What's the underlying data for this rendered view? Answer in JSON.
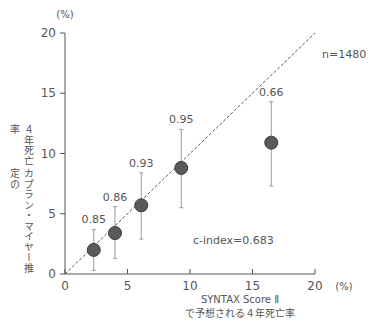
{
  "chart_data": {
    "type": "scatter",
    "title": "",
    "xlabel": "SYNTAX Score II で予想される４年死亡率",
    "xlabel_lines": [
      "SYNTAX Score Ⅱ",
      "で予想される４年死亡率"
    ],
    "ylabel": "カプラン・マイヤー推定の４年死亡率",
    "ylabel_lines": [
      "カプラン・マイヤー推定の",
      "４年死亡率"
    ],
    "x_unit": "(%)",
    "y_unit": "(%)",
    "xlim": [
      0,
      20
    ],
    "ylim": [
      0,
      20
    ],
    "x_ticks": [
      0,
      5,
      10,
      15,
      20
    ],
    "y_ticks": [
      0,
      5,
      10,
      15,
      20
    ],
    "grid": false,
    "reference_line": {
      "style": "dashed",
      "from": [
        0,
        0
      ],
      "to": [
        20,
        20
      ]
    },
    "points": [
      {
        "x": 2.3,
        "y": 2.0,
        "err_low": 0.3,
        "err_high": 3.7,
        "label": "0.85"
      },
      {
        "x": 4.0,
        "y": 3.4,
        "err_low": 1.3,
        "err_high": 5.6,
        "label": "0.86"
      },
      {
        "x": 6.1,
        "y": 5.7,
        "err_low": 2.9,
        "err_high": 8.4,
        "label": "0.93"
      },
      {
        "x": 9.3,
        "y": 8.8,
        "err_low": 5.5,
        "err_high": 12.0,
        "label": "0.95"
      },
      {
        "x": 16.5,
        "y": 10.9,
        "err_low": 7.3,
        "err_high": 14.3,
        "label": "0.66"
      }
    ],
    "annotations": {
      "n": "n=1480",
      "c_index": "c-index=0.683"
    },
    "colors": {
      "axis": "#555555",
      "marker_fill": "#5a5a5a",
      "marker_stroke": "#3a3a3a",
      "error_bar": "#9a9a9a",
      "ref_line": "#555555",
      "text": "#555555"
    }
  }
}
